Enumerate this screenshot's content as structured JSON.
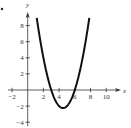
{
  "chart_data": {
    "type": "line",
    "title": "",
    "xlabel": "x",
    "ylabel": "y",
    "xlim": [
      -2.5,
      12
    ],
    "ylim": [
      -4.5,
      10
    ],
    "x_ticks": [
      -2,
      2,
      4,
      6,
      8,
      10
    ],
    "y_ticks": [
      -4,
      -2,
      2,
      4,
      6,
      8
    ],
    "x_tick_labels": [
      "−2",
      "2",
      "4",
      "6",
      "8",
      "10"
    ],
    "y_tick_labels": [
      "−4",
      "−2",
      "2",
      "4",
      "6",
      "8"
    ],
    "grid": false,
    "legend": null,
    "series": [
      {
        "name": "parabola",
        "function": "y = (x - 3)(x - 6)",
        "x": [
          1.15,
          1.5,
          2,
          2.5,
          3,
          3.5,
          4,
          4.5,
          5,
          5.5,
          6,
          6.5,
          7,
          7.5,
          7.85
        ],
        "y": [
          9.0,
          6.75,
          4.0,
          1.75,
          0,
          -1.25,
          -2.0,
          -2.25,
          -2.0,
          -1.25,
          0,
          1.75,
          4.0,
          6.75,
          9.0
        ],
        "color": "#111111"
      }
    ],
    "annotations": {
      "vertex": [
        4.5,
        -2.25
      ],
      "x_intercepts": [
        3,
        6
      ]
    }
  },
  "axes": {
    "x_label": "x",
    "y_label": "y"
  },
  "colors": {
    "axis": "#333333",
    "curve": "#111111",
    "text": "#333333"
  }
}
